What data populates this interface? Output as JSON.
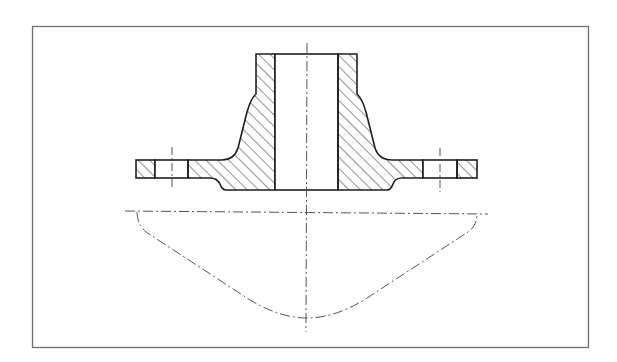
{
  "figure": {
    "type": "technical-drawing",
    "colors": {
      "background": "#ffffff",
      "frame": "#6e6e6e",
      "outline": "#1e1e1e",
      "hatch": "#2a2a2a",
      "centerline": "#555555"
    },
    "frame": {
      "x": 32,
      "y": 26,
      "width": 556,
      "height": 321
    },
    "centerline_x": 307,
    "neck": {
      "top_y": 54,
      "outer_left_x": 256,
      "inner_left_x": 275,
      "inner_right_x": 338,
      "outer_right_x": 357
    },
    "flange": {
      "left_x": 136,
      "right_x": 477,
      "top_y": 160,
      "bottom_y": 178,
      "hub_bottom_y": 190
    },
    "bolt_holes": [
      {
        "name": "left",
        "x1": 155,
        "x2": 188,
        "center_x": 172
      },
      {
        "name": "right",
        "x1": 423,
        "x2": 457,
        "center_x": 440
      }
    ],
    "stress_curve": {
      "baseline_y": 212,
      "left_x": 136,
      "right_x": 477,
      "bottom_y": 318
    }
  }
}
